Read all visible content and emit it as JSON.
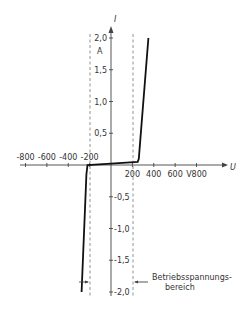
{
  "chart_data": {
    "type": "line",
    "title": "",
    "xlabel": "U",
    "ylabel": "I",
    "x_unit": "V",
    "y_unit": "A",
    "xlim": [
      -800,
      800
    ],
    "ylim": [
      -2.0,
      2.0
    ],
    "x_ticks": [
      -800,
      -600,
      -400,
      -200,
      200,
      400,
      600,
      800
    ],
    "x_tick_labels": [
      "-800",
      "-600",
      "-400",
      "-200",
      "200",
      "400",
      "600",
      "V800"
    ],
    "y_ticks": [
      2.0,
      1.5,
      1.0,
      0.5,
      -0.5,
      -1.0,
      -1.5,
      -2.0
    ],
    "y_tick_labels": [
      "2,0",
      "1,5",
      "1,0",
      "0,5",
      "-0,5",
      "-1,0",
      "-1,5",
      "-2,0"
    ],
    "grid": false,
    "series": [
      {
        "name": "Varistor I-U characteristic",
        "x": [
          -275,
          -230,
          -220,
          0,
          250,
          260,
          350
        ],
        "y": [
          -2.0,
          -0.15,
          0.0,
          0.02,
          0.05,
          0.1,
          2.0
        ]
      }
    ],
    "reference_lines": [
      {
        "type": "vertical",
        "x": -200,
        "style": "dashed"
      },
      {
        "type": "vertical",
        "x": 210,
        "style": "dashed"
      }
    ],
    "annotations": [
      {
        "text": "Betriebsspannungs-\nbereich",
        "line1": "Betriebsspannungs-",
        "line2": "bereich"
      }
    ]
  },
  "labels": {
    "y_axis": "I",
    "y_unit": "A",
    "x_axis": "U",
    "annotation_line1": "Betriebsspannungs-",
    "annotation_line2": "bereich"
  }
}
